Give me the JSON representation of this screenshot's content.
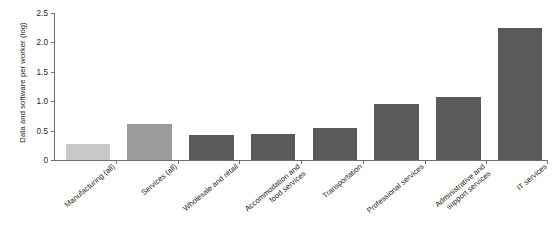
{
  "chart_data": {
    "type": "bar",
    "title": "",
    "xlabel": "",
    "ylabel": "Data and software per worker (log)",
    "ylim": [
      0,
      2.5
    ],
    "yticks": [
      "0",
      "0.5",
      "1.0",
      "1.5",
      "2.0",
      "2.5"
    ],
    "ytick_values": [
      0,
      0.5,
      1.0,
      1.5,
      2.0,
      2.5
    ],
    "grid": false,
    "legend": "none",
    "categories": [
      "Manufacturing (all)",
      "Services (all)",
      "Wholesale and retail",
      "Accommodation and food services",
      "Transportation",
      "Professional services",
      "Administrative and support services",
      "IT services"
    ],
    "category_lines": [
      [
        "Manufacturing (all)"
      ],
      [
        "Services (all)"
      ],
      [
        "Wholesale and retail"
      ],
      [
        "Accommodation and",
        "food services"
      ],
      [
        "Transportation"
      ],
      [
        "Professional services"
      ],
      [
        "Administrative and",
        "support services"
      ],
      [
        "IT services"
      ]
    ],
    "values": [
      0.28,
      0.61,
      0.42,
      0.45,
      0.55,
      0.95,
      1.07,
      2.24
    ],
    "bar_colors": [
      "#c9c9c7",
      "#9b9b99",
      "#5a5a58",
      "#5a5a58",
      "#5a5a58",
      "#5a5a58",
      "#5a5a58",
      "#5a5a58"
    ],
    "colors": {
      "axis": "#6d6e70",
      "text": "#231f20",
      "light_bar": "#c9c9c7",
      "medium_bar": "#9b9b99",
      "dark_bar": "#5a5a58",
      "background": "#ffffff"
    }
  }
}
